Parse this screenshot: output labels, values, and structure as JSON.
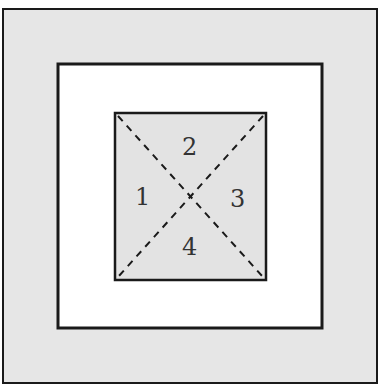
{
  "diagram": {
    "colors": {
      "outer_fill": "#e6e6e6",
      "middle_fill": "#ffffff",
      "inner_fill": "#e3e3e3",
      "stroke": "#1a1a1a"
    },
    "regions": [
      {
        "id": "1",
        "label": "1"
      },
      {
        "id": "2",
        "label": "2"
      },
      {
        "id": "3",
        "label": "3"
      },
      {
        "id": "4",
        "label": "4"
      }
    ]
  }
}
